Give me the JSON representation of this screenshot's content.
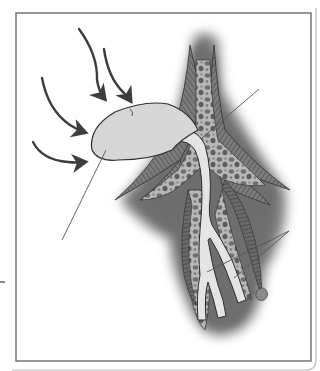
{
  "figure": {
    "type": "anatomical-illustration",
    "labels": [],
    "colors": {
      "background": "#ffffff",
      "frame": "#6b6b6b",
      "sac_fill": "#d6d6d6",
      "duct_fill": "#e4e4e4",
      "tissue_dark": "#6e6e6e",
      "tissue_mid": "#9a9a9a",
      "outline": "#2e2e2e",
      "arrow": "#4a4a4a",
      "leader_line": "#555555"
    },
    "arrows": [
      {
        "name": "arrow-top-left",
        "direction": "down-right"
      },
      {
        "name": "arrow-top-right",
        "direction": "down-right"
      },
      {
        "name": "arrow-middle",
        "direction": "right"
      },
      {
        "name": "arrow-bottom",
        "direction": "right"
      }
    ],
    "leader_lines": [
      {
        "name": "leader-sac",
        "target": "sac"
      },
      {
        "name": "leader-duct-junction",
        "target": "duct junction"
      },
      {
        "name": "leader-branches",
        "target": "duct branches (two pointers)"
      }
    ]
  }
}
